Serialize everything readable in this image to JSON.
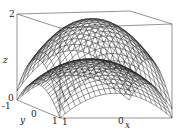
{
  "chart_data": {
    "type": "surface3d",
    "title": "",
    "function_description": "Two stacked dome-shaped wireframe surfaces (paraboloid-like), upper peaking near z=2, lower peaking near z≈1",
    "xlabel": "x",
    "ylabel": "y",
    "zlabel": "z",
    "x_ticks": [
      "1",
      "0",
      "-1"
    ],
    "y_ticks": [
      "-1",
      "0",
      "1"
    ],
    "z_ticks": [
      "0",
      "2"
    ],
    "xlim": [
      -1,
      1
    ],
    "ylim": [
      -1,
      1
    ],
    "zlim": [
      0,
      2
    ],
    "grid": false,
    "box": true,
    "series": [
      {
        "name": "upper surface",
        "peak_z": 2,
        "style": "wireframe mesh"
      },
      {
        "name": "lower surface",
        "peak_z": 1,
        "style": "wireframe mesh"
      }
    ],
    "colors": {
      "mesh": "#1a1a1a",
      "box": "#555555",
      "background": "#ffffff"
    }
  },
  "labels": {
    "z_axis": "z",
    "y_axis": "y",
    "x_axis": "x",
    "z_tick_top": "2",
    "z_tick_bottom": "0",
    "y_tick_neg": "-1",
    "y_tick_zero": "0",
    "y_tick_pos": "1",
    "x_tick_pos": "1",
    "x_tick_zero": "0",
    "x_tick_neg": "-1"
  }
}
